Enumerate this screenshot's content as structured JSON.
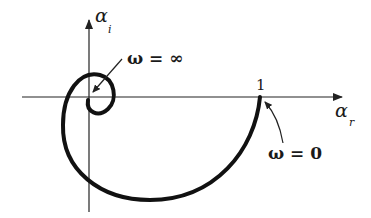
{
  "diagram": {
    "type": "nyquist-plot",
    "axes": {
      "vertical": {
        "symbol": "α",
        "subscript": "i"
      },
      "horizontal": {
        "symbol": "α",
        "subscript": "r"
      }
    },
    "tick_label": "1",
    "annotations": {
      "omega_infinity": "ω = ∞",
      "omega_zero": "ω = 0"
    },
    "colors": {
      "curve": "#111111",
      "axis": "#222222",
      "background": "#ffffff"
    }
  }
}
